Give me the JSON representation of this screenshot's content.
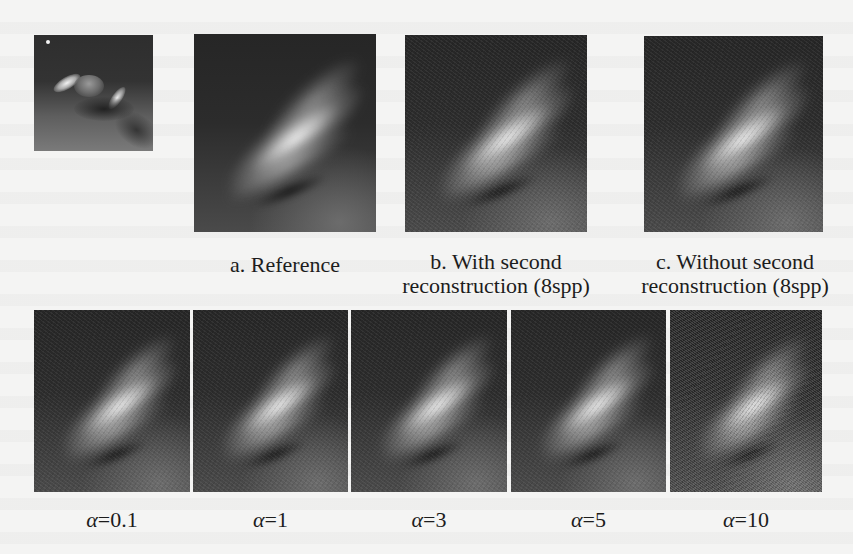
{
  "figure": {
    "thumbnail": {
      "description": "Full scene thumbnail with light source and vehicles"
    },
    "top_row": [
      {
        "id": "a",
        "caption_lines": [
          "a. Reference"
        ]
      },
      {
        "id": "b",
        "caption_lines": [
          "b. With second",
          "reconstruction (8spp)"
        ]
      },
      {
        "id": "c",
        "caption_lines": [
          "c. Without second",
          "reconstruction (8spp)"
        ]
      }
    ],
    "bottom_row": [
      {
        "symbol": "α",
        "value_text": "=0.1"
      },
      {
        "symbol": "α",
        "value_text": "=1"
      },
      {
        "symbol": "α",
        "value_text": "=3"
      },
      {
        "symbol": "α",
        "value_text": "=5"
      },
      {
        "symbol": "α",
        "value_text": "=10"
      }
    ]
  },
  "colors": {
    "page_background": "#f4f4f3",
    "image_dark": "#2b2b2b",
    "caption_text": "#1c1c1c"
  }
}
